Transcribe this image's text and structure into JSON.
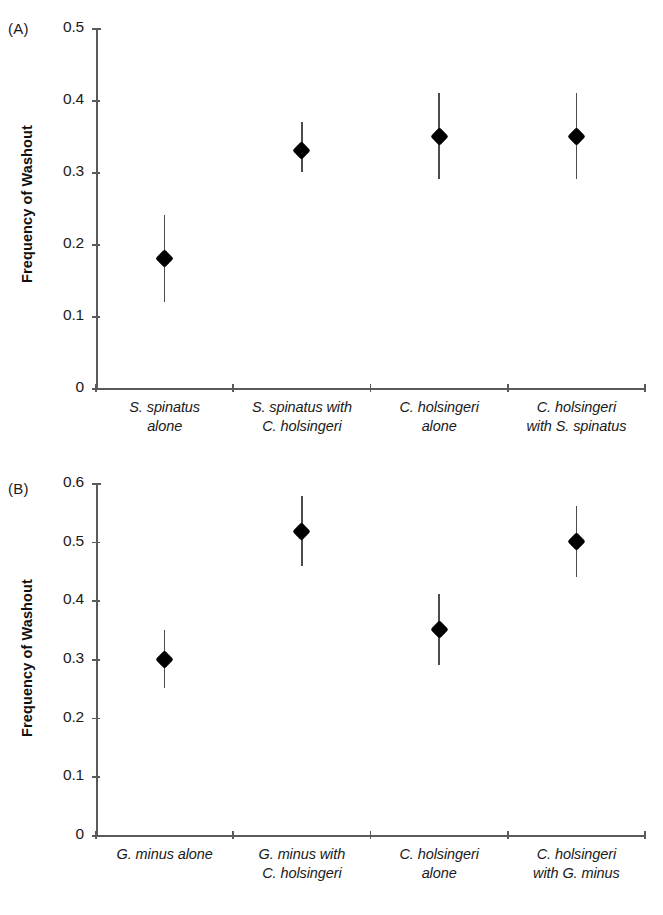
{
  "figure": {
    "panel_a_tag": "(A)",
    "panel_b_tag": "(B)",
    "y_axis_title": "Frequency of Washout"
  },
  "chart_data": [
    {
      "type": "scatter",
      "panel": "(A)",
      "title": "",
      "xlabel": "",
      "ylabel": "Frequency of Washout",
      "ylim": [
        0,
        0.5
      ],
      "yticks": [
        "0",
        "0.1",
        "0.2",
        "0.3",
        "0.4",
        "0.5"
      ],
      "ytick_values": [
        0,
        0.1,
        0.2,
        0.3,
        0.4,
        0.5
      ],
      "grid": false,
      "legend": "none",
      "error_type": "error bars",
      "categories": [
        [
          "S. spinatus",
          "alone"
        ],
        [
          "S. spinatus with",
          "C. holsingeri"
        ],
        [
          "C. holsingeri",
          "alone"
        ],
        [
          "C. holsingeri",
          "with S. spinatus"
        ]
      ],
      "category_labels": [
        "S. spinatus alone",
        "S. spinatus with C. holsingeri",
        "C. holsingeri alone",
        "C. holsingeri with S. spinatus"
      ],
      "values": [
        0.18,
        0.33,
        0.35,
        0.35
      ],
      "error_low": [
        0.12,
        0.3,
        0.29,
        0.29
      ],
      "error_high": [
        0.24,
        0.37,
        0.41,
        0.41
      ]
    },
    {
      "type": "scatter",
      "panel": "(B)",
      "title": "",
      "xlabel": "",
      "ylabel": "Frequency of Washout",
      "ylim": [
        0,
        0.6
      ],
      "yticks": [
        "0",
        "0.1",
        "0.2",
        "0.3",
        "0.4",
        "0.5",
        "0.6"
      ],
      "ytick_values": [
        0,
        0.1,
        0.2,
        0.3,
        0.4,
        0.5,
        0.6
      ],
      "grid": false,
      "legend": "none",
      "error_type": "error bars",
      "categories": [
        [
          "G. minus alone"
        ],
        [
          "G. minus with",
          "C. holsingeri"
        ],
        [
          "C. holsingeri",
          "alone"
        ],
        [
          "C. holsingeri",
          "with  G. minus"
        ]
      ],
      "category_labels": [
        "G. minus alone",
        "G. minus with C. holsingeri",
        "C. holsingeri alone",
        "C. holsingeri with G. minus"
      ],
      "values": [
        0.3,
        0.518,
        0.35,
        0.5
      ],
      "error_low": [
        0.25,
        0.458,
        0.29,
        0.44
      ],
      "error_high": [
        0.35,
        0.578,
        0.41,
        0.56
      ]
    }
  ],
  "colors": {
    "marker": "#000000",
    "axis": "#5a5a5a",
    "error": "#4c4c4c",
    "text": "#1a1a1a",
    "background": "#ffffff"
  }
}
